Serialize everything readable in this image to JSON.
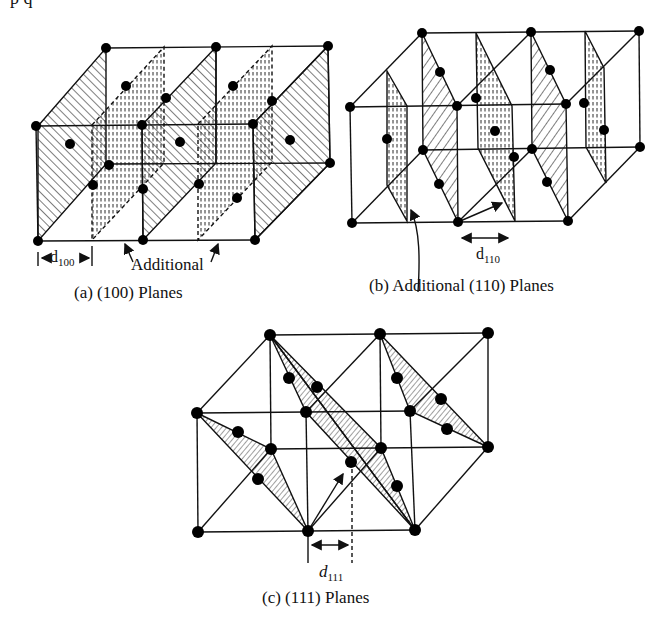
{
  "header_fragment": "p    q",
  "diagrams": {
    "a": {
      "caption": "(a) (100) Planes",
      "annotation": "Additional",
      "spacing_label": {
        "symbol": "d",
        "subscript": "100"
      }
    },
    "b": {
      "caption": "(b) Additional (110) Planes",
      "spacing_label": {
        "symbol": "d",
        "subscript": "110"
      }
    },
    "c": {
      "caption": "(c) (111) Planes",
      "spacing_label": {
        "symbol": "d",
        "subscript": "111"
      }
    }
  },
  "colors": {
    "line": "#111111",
    "atom": "#000000",
    "background": "#ffffff"
  }
}
